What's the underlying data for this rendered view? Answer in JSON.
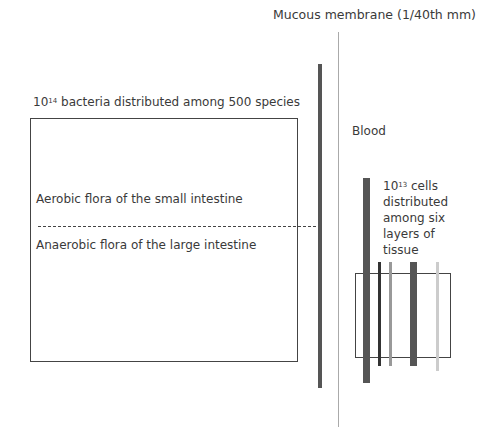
{
  "labels": {
    "membrane": "Mucous membrane (1/40th mm)",
    "bacteria_base": "10",
    "bacteria_exp": "14",
    "bacteria_rest": " bacteria distributed among 500 species",
    "blood": "Blood",
    "aerobic": "Aerobic flora of the small intestine",
    "anaerobic": "Anaerobic flora of the large intestine",
    "cells_base": "10",
    "cells_exp": "13",
    "cells_line1": " cells",
    "cells_line2": "distributed",
    "cells_line3": "among six",
    "cells_line4": "layers of",
    "cells_line5": "tissue"
  },
  "colors": {
    "dark_bar": "#555555",
    "black_bar": "#333333",
    "mid_grey_bar": "#999999",
    "light_grey_bar": "#cccccc",
    "thin_line": "#aaaaaa"
  }
}
